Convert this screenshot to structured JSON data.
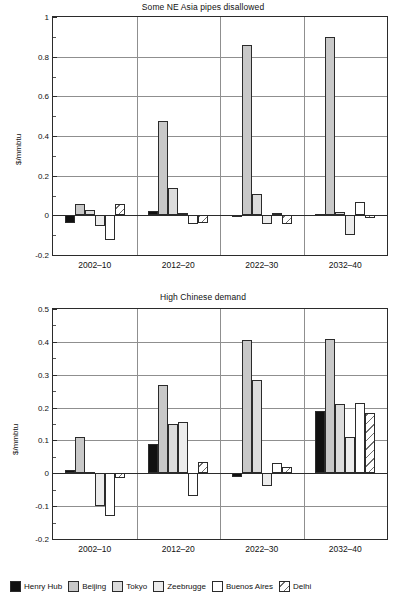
{
  "figure": {
    "width": 406,
    "height": 613,
    "background": "#ffffff"
  },
  "series_styles": {
    "Henry Hub": "#111111",
    "Beijing": "#c8c8c8",
    "Tokyo": "#dcdcdc",
    "Zeebrugge": "#ececec",
    "Buenos Aires": "#ffffff",
    "Delhi": "hatched-diagonal"
  },
  "legend": {
    "position": "bottom",
    "entries": [
      {
        "label": "Henry Hub",
        "fill": "#111111",
        "style": "solid"
      },
      {
        "label": "Beijing",
        "fill": "#c8c8c8",
        "style": "solid"
      },
      {
        "label": "Tokyo",
        "fill": "#dcdcdc",
        "style": "solid"
      },
      {
        "label": "Zeebrugge",
        "fill": "#ececec",
        "style": "solid"
      },
      {
        "label": "Buenos Aires",
        "fill": "#ffffff",
        "style": "solid"
      },
      {
        "label": "Delhi",
        "fill": "#ffffff",
        "style": "hatch"
      }
    ]
  },
  "chart_data": [
    {
      "id": "top",
      "type": "bar",
      "title": "Some NE Asia pipes disallowed",
      "xlabel": "",
      "ylabel": "$/mmbtu",
      "ylim": [
        -0.2,
        1.0
      ],
      "yticks": [
        -0.2,
        0,
        0.2,
        0.4,
        0.6,
        0.8,
        1.0
      ],
      "ytick_labels": [
        "-0.2",
        "0",
        "0.2",
        "0.4",
        "0.6",
        "0.8",
        "1"
      ],
      "grid": true,
      "categories": [
        "2002–10",
        "2012–20",
        "2022–30",
        "2032–40"
      ],
      "series": [
        {
          "name": "Henry Hub",
          "values": [
            -0.04,
            0.02,
            -0.01,
            0.005
          ]
        },
        {
          "name": "Beijing",
          "values": [
            0.055,
            0.475,
            0.86,
            0.9
          ]
        },
        {
          "name": "Tokyo",
          "values": [
            0.025,
            0.14,
            0.11,
            0.015
          ]
        },
        {
          "name": "Zeebrugge",
          "values": [
            -0.055,
            0.01,
            -0.045,
            -0.1
          ]
        },
        {
          "name": "Buenos Aires",
          "values": [
            -0.125,
            -0.045,
            0.01,
            0.065
          ]
        },
        {
          "name": "Delhi",
          "values": [
            0.055,
            -0.04,
            -0.045,
            -0.015
          ]
        }
      ]
    },
    {
      "id": "bottom",
      "type": "bar",
      "title": "High Chinese demand",
      "xlabel": "",
      "ylabel": "$/mmbtu",
      "ylim": [
        -0.2,
        0.5
      ],
      "yticks": [
        -0.2,
        -0.1,
        0,
        0.1,
        0.2,
        0.3,
        0.4,
        0.5
      ],
      "ytick_labels": [
        "-0.2",
        "-0.1",
        "0",
        "0.1",
        "0.2",
        "0.3",
        "0.4",
        "0.5"
      ],
      "grid": true,
      "categories": [
        "2002–10",
        "2012–20",
        "2022–30",
        "2032–40"
      ],
      "series": [
        {
          "name": "Henry Hub",
          "values": [
            0.01,
            0.09,
            -0.01,
            0.19
          ]
        },
        {
          "name": "Beijing",
          "values": [
            0.11,
            0.27,
            0.405,
            0.41
          ]
        },
        {
          "name": "Tokyo",
          "values": [
            0.005,
            0.15,
            0.285,
            0.21
          ]
        },
        {
          "name": "Zeebrugge",
          "values": [
            -0.1,
            0.155,
            -0.04,
            0.11
          ]
        },
        {
          "name": "Buenos Aires",
          "values": [
            -0.13,
            -0.07,
            0.03,
            0.215
          ]
        },
        {
          "name": "Delhi",
          "values": [
            -0.015,
            0.035,
            0.02,
            0.185
          ]
        }
      ]
    }
  ]
}
